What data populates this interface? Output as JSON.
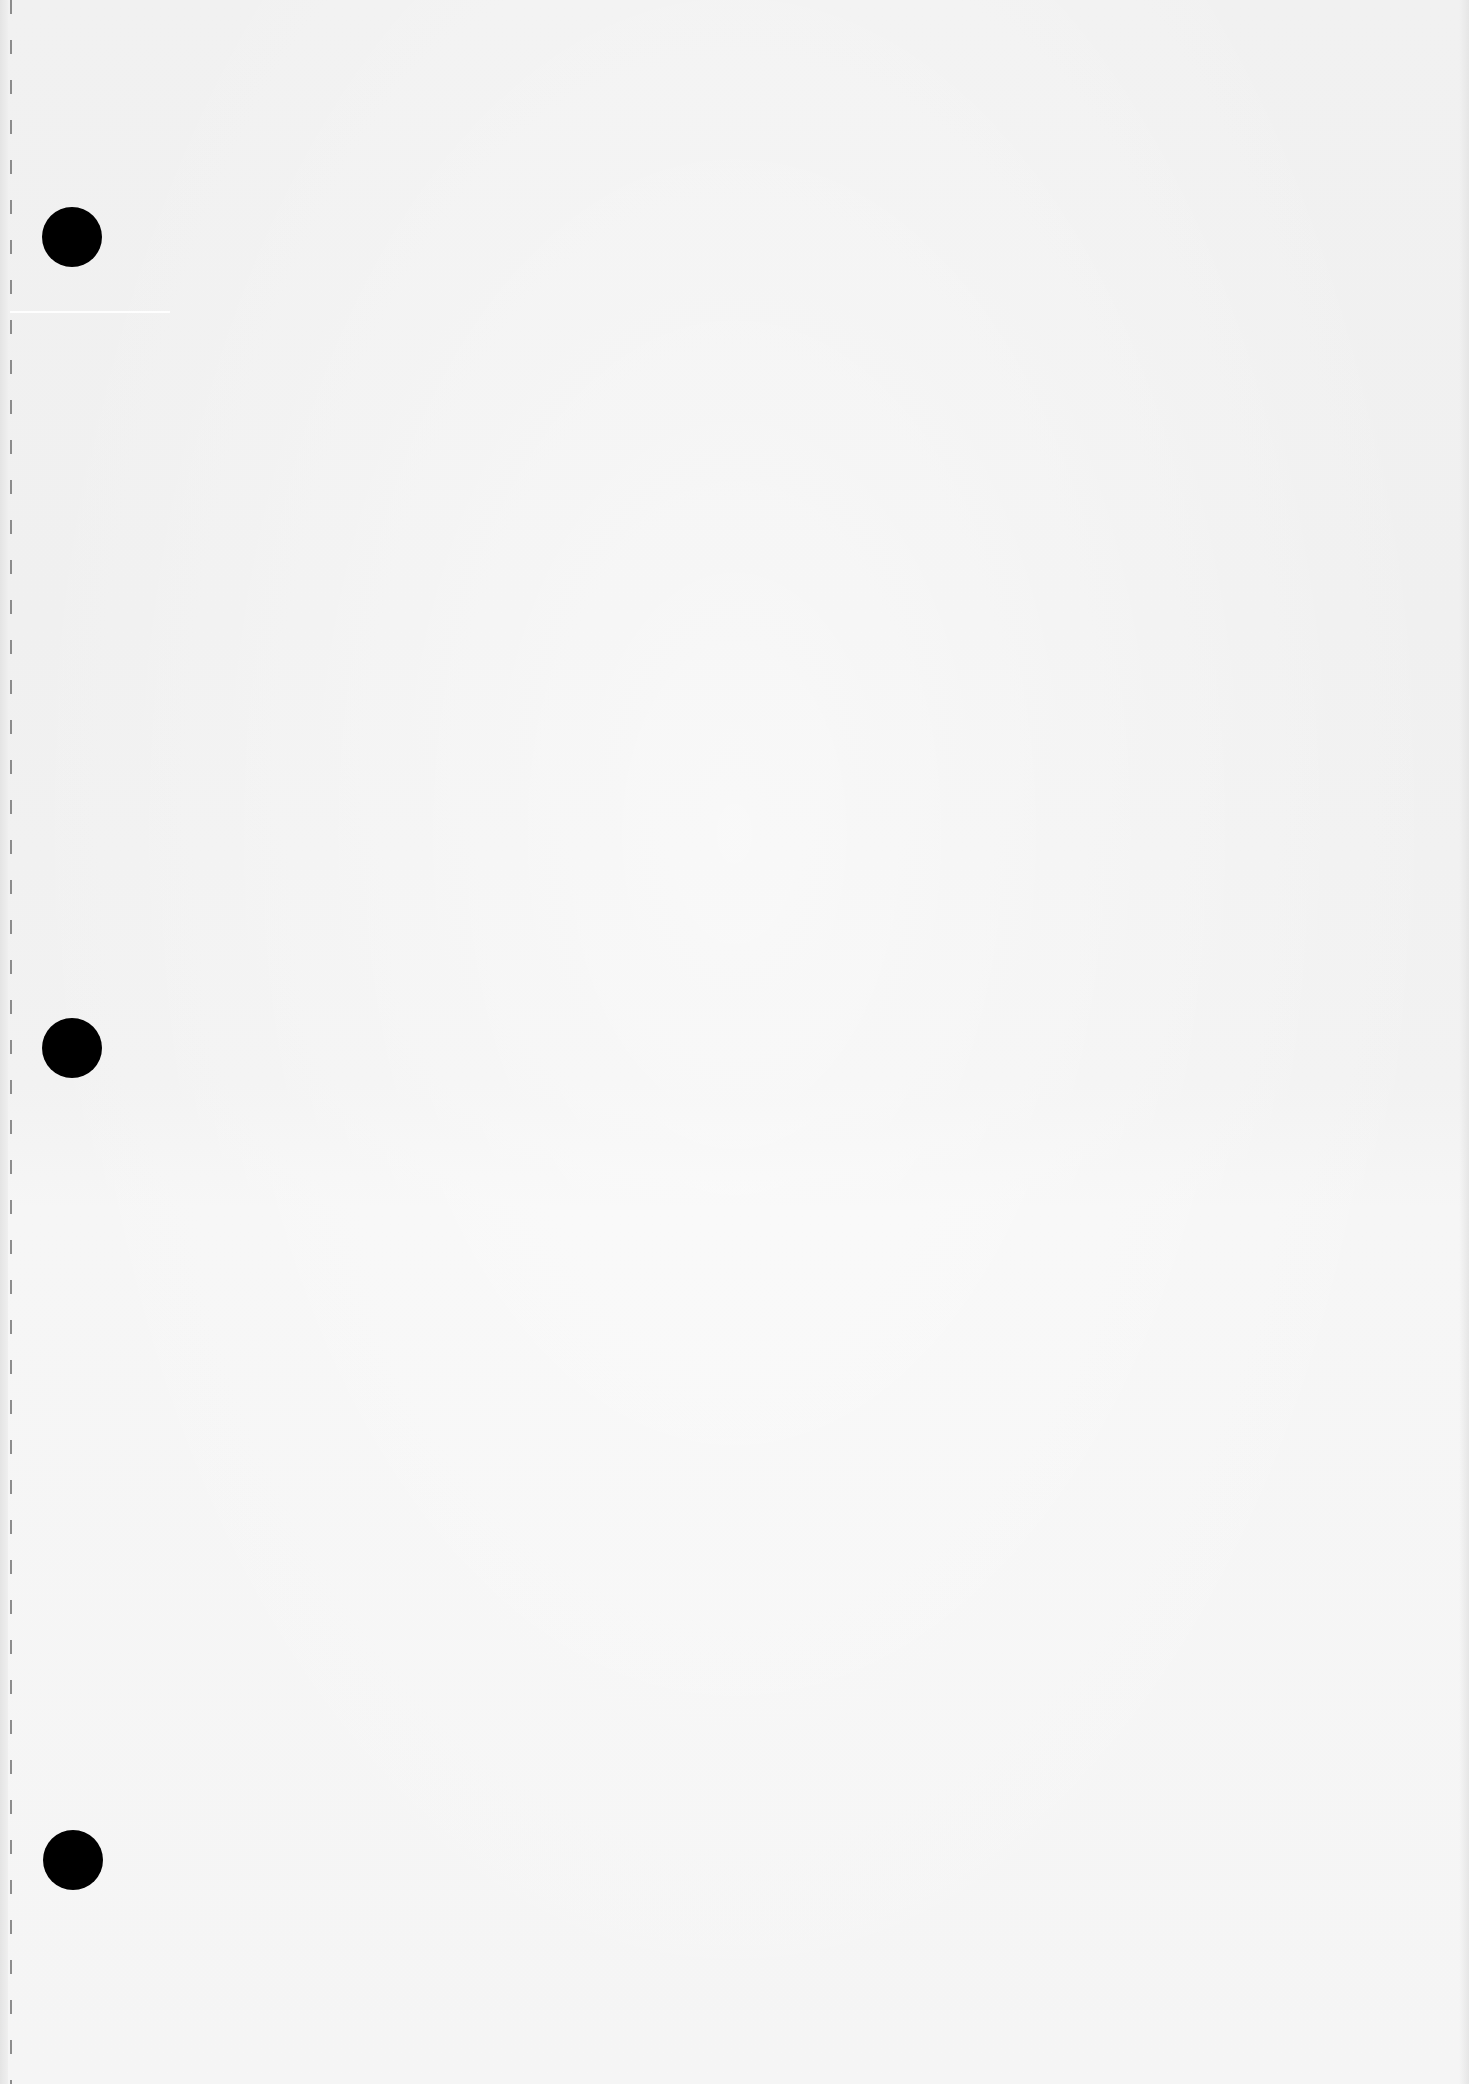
{
  "document": {
    "type": "blank-scanned-page",
    "text_content": "",
    "dimensions": {
      "width": 1469,
      "height": 2084
    }
  },
  "colors": {
    "paper": "#f3f3f3",
    "punch_hole": "#000000",
    "perforation": "#6a6a6a"
  },
  "perforation": {
    "x": 10,
    "dash": 14,
    "gap": 26
  },
  "scan_streak": {
    "x": 10,
    "y": 311,
    "width": 160
  },
  "punch_holes": [
    {
      "cx": 72,
      "cy": 237,
      "d": 60
    },
    {
      "cx": 72,
      "cy": 1048,
      "d": 60
    },
    {
      "cx": 73,
      "cy": 1860,
      "d": 60
    }
  ]
}
